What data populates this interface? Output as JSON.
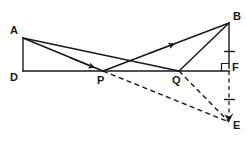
{
  "figure": {
    "type": "geometry-diagram",
    "width": 247,
    "height": 143,
    "background_color": "#ffffff",
    "stroke_color": "#1a1a1a",
    "labels": {
      "A": "A",
      "B": "B",
      "D": "D",
      "E": "E",
      "F": "F",
      "P": "P",
      "Q": "Q"
    },
    "points": {
      "A": {
        "x": 23,
        "y": 38
      },
      "B": {
        "x": 229,
        "y": 23
      },
      "D": {
        "x": 23,
        "y": 71
      },
      "E": {
        "x": 229,
        "y": 122
      },
      "F": {
        "x": 229,
        "y": 68
      },
      "P": {
        "x": 103,
        "y": 71
      },
      "Q": {
        "x": 179,
        "y": 71
      }
    },
    "segments": [
      {
        "name": "A-D",
        "from": "A",
        "to": "D",
        "style": "solid"
      },
      {
        "name": "D-F",
        "from": "D",
        "to": "F",
        "style": "solid"
      },
      {
        "name": "A-P",
        "from": "A",
        "to": "P",
        "style": "solid",
        "arrow": true
      },
      {
        "name": "A-Q",
        "from": "A",
        "to": "Q",
        "style": "solid"
      },
      {
        "name": "P-B",
        "from": "P",
        "to": "B",
        "style": "solid",
        "arrow": true
      },
      {
        "name": "Q-B",
        "from": "Q",
        "to": "B",
        "style": "solid"
      },
      {
        "name": "B-F",
        "from": "B",
        "to": "F",
        "style": "solid"
      },
      {
        "name": "F-E",
        "from": "F",
        "to": "E",
        "style": "dashed"
      },
      {
        "name": "P-E",
        "from": "P",
        "to": "E",
        "style": "dashed"
      },
      {
        "name": "Q-E",
        "from": "Q",
        "to": "E",
        "style": "dashed"
      }
    ],
    "marks": {
      "right_angle_at_F": {
        "x": 221,
        "y": 62,
        "size": 7
      },
      "tick_BF": {
        "x": 229,
        "y": 52
      },
      "tick_FE": {
        "x": 229,
        "y": 99
      }
    }
  }
}
